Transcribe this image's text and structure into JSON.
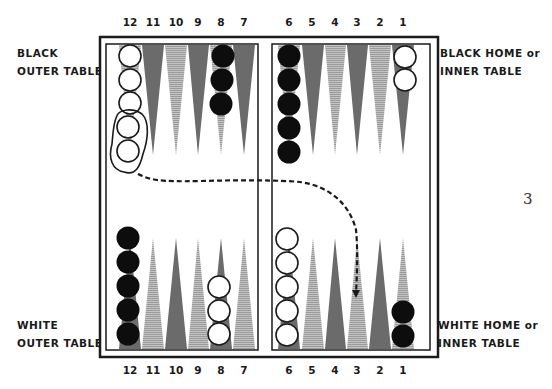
{
  "labels": {
    "black_outer_line1": "BLACK",
    "black_outer_line2": "OUTER TABLE",
    "black_home_line1": "BLACK HOME or",
    "black_home_line2": "INNER TABLE",
    "white_outer_line1": "WHITE",
    "white_outer_line2": "OUTER TABLE",
    "white_home_line1": "WHITE HOME or",
    "white_home_line2": "INNER TABLE"
  },
  "page_number": "3",
  "top_numbers": [
    "12",
    "11",
    "10",
    "9",
    "8",
    "7",
    "6",
    "5",
    "4",
    "3",
    "2",
    "1"
  ],
  "bottom_numbers": [
    "12",
    "11",
    "10",
    "9",
    "8",
    "7",
    "6",
    "5",
    "4",
    "3",
    "2",
    "1"
  ],
  "checkers": {
    "top": [
      {
        "point": "12",
        "color": "white",
        "count": 5
      },
      {
        "point": "8",
        "color": "black",
        "count": 3
      },
      {
        "point": "6",
        "color": "black",
        "count": 5
      },
      {
        "point": "1",
        "color": "white",
        "count": 2
      }
    ],
    "bottom": [
      {
        "point": "12",
        "color": "black",
        "count": 5
      },
      {
        "point": "8",
        "color": "white",
        "count": 3
      },
      {
        "point": "6",
        "color": "white",
        "count": 5
      },
      {
        "point": "1",
        "color": "black",
        "count": 2
      }
    ]
  },
  "move_indicator": {
    "from": "top-12 (two circled white checkers)",
    "to": "bottom-3",
    "style": "dashed-arrow"
  },
  "colors": {
    "dark_point": "#6b6b6b",
    "light_point": "#b5b5b5",
    "line": "#1a1a1a",
    "checker_black": "#0d0d0d",
    "checker_white": "#ffffff"
  }
}
